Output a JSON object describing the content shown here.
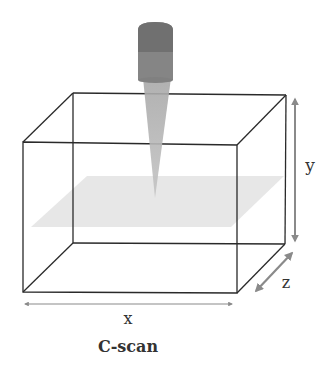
{
  "diagram": {
    "title": "C-scan",
    "axes": {
      "x_label": "x",
      "y_label": "y",
      "z_label": "z"
    },
    "elements": {
      "transducer": "ultrasonic-transducer-probe",
      "beam": "ultrasound-beam-cone",
      "scan_plane": "c-scan-plane",
      "specimen": "rectangular-box"
    },
    "colors": {
      "edges": "#2a2a2a",
      "arrows": "#8a8a8a",
      "transducer_top": "#707070",
      "transducer_body": "#858585",
      "beam": "#b0b0b0",
      "plane": "#e2e2e2"
    }
  }
}
